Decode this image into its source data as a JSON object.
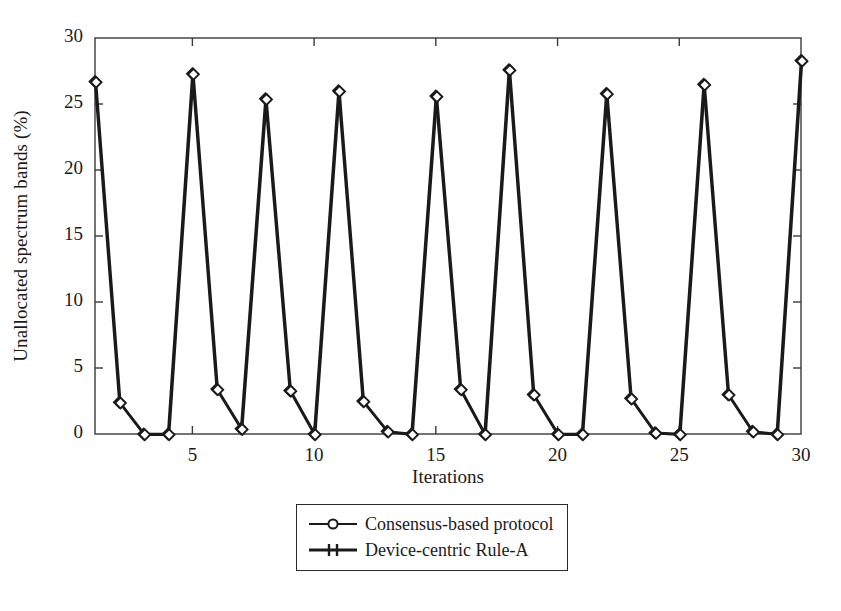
{
  "chart_data": {
    "type": "line",
    "title": "",
    "xlabel": "Iterations",
    "ylabel": "Unallocated spectrum bands (%)",
    "xlim": [
      1,
      30
    ],
    "ylim": [
      0,
      30
    ],
    "grid": false,
    "legend_position": "below-axes-center",
    "xticks": [
      5,
      10,
      15,
      20,
      25,
      30
    ],
    "yticks": [
      0,
      5,
      10,
      15,
      20,
      25,
      30
    ],
    "x": [
      1,
      2,
      3,
      4,
      5,
      6,
      7,
      8,
      9,
      10,
      11,
      12,
      13,
      14,
      15,
      16,
      17,
      18,
      19,
      20,
      21,
      22,
      23,
      24,
      25,
      26,
      27,
      28,
      29,
      30
    ],
    "series": [
      {
        "name": "Consensus-based protocol",
        "marker": "circle",
        "color": "#1a1a1a",
        "values": [
          26.7,
          2.4,
          0.0,
          0.0,
          27.3,
          3.4,
          0.4,
          25.4,
          3.3,
          0.0,
          26.0,
          2.5,
          0.2,
          0.0,
          25.6,
          3.4,
          0.0,
          27.6,
          3.0,
          0.0,
          0.0,
          25.8,
          2.7,
          0.1,
          0.0,
          26.5,
          3.0,
          0.2,
          0.0,
          28.3
        ]
      },
      {
        "name": "Device-centric Rule-A",
        "marker": "plus",
        "color": "#1a1a1a",
        "values": [
          26.7,
          2.4,
          0.0,
          0.0,
          27.3,
          3.4,
          0.4,
          25.4,
          3.3,
          0.0,
          26.0,
          2.5,
          0.2,
          0.0,
          25.6,
          3.4,
          0.0,
          27.6,
          3.0,
          0.0,
          0.0,
          25.8,
          2.7,
          0.1,
          0.0,
          26.5,
          3.0,
          0.2,
          0.0,
          28.3
        ]
      }
    ]
  },
  "legend": {
    "items": [
      {
        "label": "Consensus-based protocol",
        "marker": "circle"
      },
      {
        "label": "Device-centric Rule-A",
        "marker": "plus"
      }
    ]
  },
  "axes": {
    "ytick_labels": [
      "30",
      "25",
      "20",
      "15",
      "10",
      "5",
      "0"
    ],
    "xtick_labels": [
      "5",
      "10",
      "15",
      "20",
      "25",
      "30"
    ]
  },
  "style": {
    "line_color": "#1a1a1a",
    "axis_color": "#3a3a3a",
    "background": "#ffffff"
  }
}
